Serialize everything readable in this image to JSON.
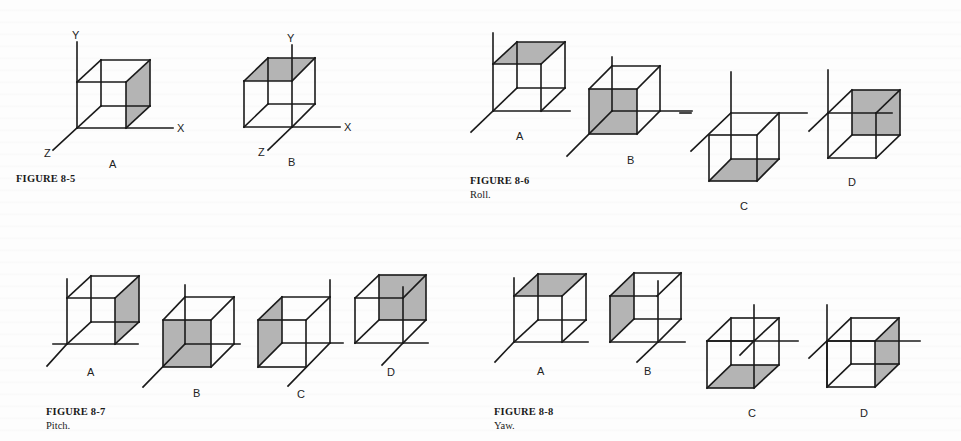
{
  "figures": [
    {
      "id": "8-5",
      "title": "FIGURE 8-5",
      "caption": "",
      "panels": [
        {
          "label": "A",
          "shaded_face": "right",
          "axis_labels": {
            "x": "X",
            "y": "Y",
            "z": "Z"
          }
        },
        {
          "label": "B",
          "shaded_face": "top",
          "axis_labels": {
            "x": "X",
            "y": "Y",
            "z": "Z"
          }
        }
      ]
    },
    {
      "id": "8-6",
      "title": "FIGURE 8-6",
      "caption": "Roll.",
      "panels": [
        {
          "label": "A",
          "shaded_face": "top"
        },
        {
          "label": "B",
          "shaded_face": "front"
        },
        {
          "label": "C",
          "shaded_face": "bottom"
        },
        {
          "label": "D",
          "shaded_face": "back"
        }
      ]
    },
    {
      "id": "8-7",
      "title": "FIGURE 8-7",
      "caption": "Pitch.",
      "panels": [
        {
          "label": "A",
          "shaded_face": "right"
        },
        {
          "label": "B",
          "shaded_face": "front"
        },
        {
          "label": "C",
          "shaded_face": "left"
        },
        {
          "label": "D",
          "shaded_face": "back"
        }
      ]
    },
    {
      "id": "8-8",
      "title": "FIGURE 8-8",
      "caption": "Yaw.",
      "panels": [
        {
          "label": "A",
          "shaded_face": "top"
        },
        {
          "label": "B",
          "shaded_face": "left"
        },
        {
          "label": "C",
          "shaded_face": "bottom"
        },
        {
          "label": "D",
          "shaded_face": "right"
        }
      ]
    }
  ],
  "colors": {
    "line": "#1a1a1a",
    "shade": "#b4b4b4",
    "paper": "#fdfdfd"
  }
}
